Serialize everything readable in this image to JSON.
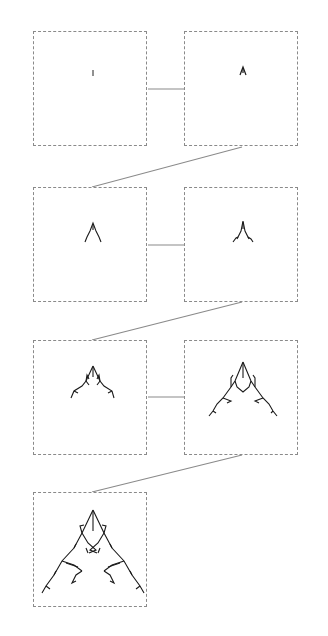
{
  "diagram": {
    "type": "fractal-growth-sequence",
    "layout": "zigzag grid, 2 columns, 4 rows",
    "stages": [
      {
        "index": 1,
        "row": 1,
        "col": 1,
        "label": "",
        "shape": "single short vertical stroke"
      },
      {
        "index": 2,
        "row": 1,
        "col": 2,
        "label": "",
        "shape": "small A-like peak"
      },
      {
        "index": 3,
        "row": 2,
        "col": 1,
        "label": "",
        "shape": "inverted-V with slight hooks"
      },
      {
        "index": 4,
        "row": 2,
        "col": 2,
        "label": "",
        "shape": "inverted-V with curled ends"
      },
      {
        "index": 5,
        "row": 3,
        "col": 1,
        "label": "",
        "shape": "branching peak with side arms"
      },
      {
        "index": 6,
        "row": 3,
        "col": 2,
        "label": "",
        "shape": "larger branching triangular fractal"
      },
      {
        "index": 7,
        "row": 4,
        "col": 1,
        "label": "",
        "shape": "full branching triangular fractal"
      }
    ],
    "connectors": [
      {
        "from": 1,
        "to": 2,
        "style": "horizontal"
      },
      {
        "from": 2,
        "to": 3,
        "style": "diagonal"
      },
      {
        "from": 3,
        "to": 4,
        "style": "horizontal"
      },
      {
        "from": 4,
        "to": 5,
        "style": "diagonal"
      },
      {
        "from": 5,
        "to": 6,
        "style": "horizontal"
      },
      {
        "from": 6,
        "to": 7,
        "style": "diagonal"
      }
    ],
    "colors": {
      "frame_border": "#8a8a8a",
      "connector": "#8a8a8a",
      "stroke": "#1a1a1a",
      "background": "#ffffff"
    }
  }
}
